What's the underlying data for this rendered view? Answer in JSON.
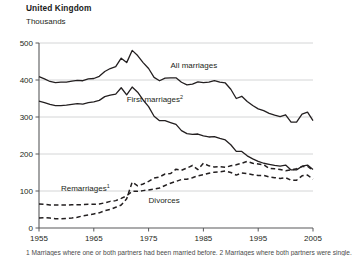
{
  "header": {
    "title": "United Kingdom",
    "units": "Thousands"
  },
  "footnote": "1 Marriages where one or both partners had been married before. 2 Marriages where both partners were single.",
  "chart_data": {
    "type": "line",
    "title": "United Kingdom",
    "subtitle": "Thousands",
    "xlabel": "",
    "ylabel": "Thousands",
    "xlim": [
      1955,
      2005
    ],
    "ylim": [
      0,
      500
    ],
    "yticks": [
      0,
      100,
      200,
      300,
      400,
      500
    ],
    "xticks": [
      1955,
      1965,
      1975,
      1985,
      1995,
      2005
    ],
    "grid": "horizontal",
    "legend": "inline-annotations",
    "series": [
      {
        "name": "All marriages",
        "style": "solid",
        "color": "#231f20",
        "label_x": 1979,
        "label_y": 432,
        "x": [
          1955,
          1956,
          1957,
          1958,
          1959,
          1960,
          1961,
          1962,
          1963,
          1964,
          1965,
          1966,
          1967,
          1968,
          1969,
          1970,
          1971,
          1972,
          1973,
          1974,
          1975,
          1976,
          1977,
          1978,
          1979,
          1980,
          1981,
          1982,
          1983,
          1984,
          1985,
          1986,
          1987,
          1988,
          1989,
          1990,
          1991,
          1992,
          1993,
          1994,
          1995,
          1996,
          1997,
          1998,
          1999,
          2000,
          2001,
          2002,
          2003,
          2004,
          2005
        ],
        "values": [
          409,
          403,
          396,
          393,
          394,
          394,
          397,
          399,
          398,
          403,
          404,
          410,
          423,
          431,
          436,
          459,
          447,
          480,
          466,
          447,
          431,
          407,
          398,
          405,
          406,
          406,
          394,
          387,
          389,
          395,
          393,
          394,
          398,
          394,
          392,
          375,
          350,
          356,
          342,
          331,
          322,
          317,
          310,
          305,
          301,
          306,
          286,
          286,
          308,
          313,
          290
        ]
      },
      {
        "name": "First marriages",
        "superscript": "2",
        "style": "solid",
        "color": "#231f20",
        "label_x": 1971,
        "label_y": 340,
        "x": [
          1955,
          1956,
          1957,
          1958,
          1959,
          1960,
          1961,
          1962,
          1963,
          1964,
          1965,
          1966,
          1967,
          1968,
          1969,
          1970,
          1971,
          1972,
          1973,
          1974,
          1975,
          1976,
          1977,
          1978,
          1979,
          1980,
          1981,
          1982,
          1983,
          1984,
          1985,
          1986,
          1987,
          1988,
          1989,
          1990,
          1991,
          1992,
          1993,
          1994,
          1995,
          1996,
          1997,
          1998,
          1999,
          2000,
          2001,
          2002,
          2003,
          2004,
          2005
        ],
        "values": [
          343,
          339,
          334,
          331,
          331,
          332,
          334,
          336,
          335,
          339,
          341,
          345,
          355,
          359,
          362,
          379,
          360,
          381,
          367,
          346,
          328,
          302,
          290,
          290,
          285,
          280,
          263,
          255,
          253,
          254,
          249,
          246,
          247,
          242,
          238,
          225,
          207,
          207,
          195,
          187,
          180,
          175,
          172,
          169,
          167,
          170,
          157,
          157,
          167,
          170,
          158
        ]
      },
      {
        "name": "Remarriages",
        "superscript": "1",
        "style": "dashed",
        "color": "#231f20",
        "label_x": 1959,
        "label_y": 100,
        "x": [
          1955,
          1956,
          1957,
          1958,
          1959,
          1960,
          1961,
          1962,
          1963,
          1964,
          1965,
          1966,
          1967,
          1968,
          1969,
          1970,
          1971,
          1972,
          1973,
          1974,
          1975,
          1976,
          1977,
          1978,
          1979,
          1980,
          1981,
          1982,
          1983,
          1984,
          1985,
          1986,
          1987,
          1988,
          1989,
          1990,
          1991,
          1992,
          1993,
          1994,
          1995,
          1996,
          1997,
          1998,
          1999,
          2000,
          2001,
          2002,
          2003,
          2004,
          2005
        ],
        "values": [
          65,
          64,
          62,
          62,
          62,
          62,
          63,
          63,
          63,
          64,
          64,
          65,
          68,
          72,
          74,
          80,
          87,
          99,
          99,
          101,
          103,
          105,
          108,
          115,
          121,
          126,
          131,
          132,
          136,
          141,
          144,
          148,
          151,
          152,
          154,
          150,
          143,
          149,
          147,
          144,
          142,
          142,
          138,
          136,
          134,
          136,
          129,
          129,
          141,
          143,
          132
        ]
      },
      {
        "name": "Divorces",
        "style": "dashed",
        "color": "#231f20",
        "label_x": 1975,
        "label_y": 68,
        "x": [
          1955,
          1956,
          1957,
          1958,
          1959,
          1960,
          1961,
          1962,
          1963,
          1964,
          1965,
          1966,
          1967,
          1968,
          1969,
          1970,
          1971,
          1972,
          1973,
          1974,
          1975,
          1976,
          1977,
          1978,
          1979,
          1980,
          1981,
          1982,
          1983,
          1984,
          1985,
          1986,
          1987,
          1988,
          1989,
          1990,
          1991,
          1992,
          1993,
          1994,
          1995,
          1996,
          1997,
          1998,
          1999,
          2000,
          2001,
          2002,
          2003,
          2004,
          2005
        ],
        "values": [
          27,
          28,
          27,
          25,
          25,
          26,
          27,
          29,
          33,
          35,
          38,
          41,
          47,
          50,
          56,
          62,
          79,
          124,
          114,
          119,
          126,
          135,
          138,
          146,
          147,
          159,
          156,
          162,
          169,
          158,
          175,
          168,
          165,
          166,
          164,
          168,
          171,
          175,
          180,
          175,
          173,
          171,
          161,
          160,
          158,
          155,
          157,
          160,
          166,
          167,
          155
        ]
      }
    ]
  }
}
